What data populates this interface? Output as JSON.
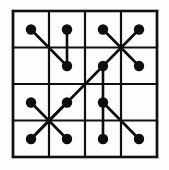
{
  "figure": {
    "type": "grid-diagram",
    "background_color": "#fdfdfd",
    "ink_color": "#0d0d0d",
    "grid": {
      "rows": 4,
      "cols": 4,
      "left": 13,
      "top": 11,
      "right": 157,
      "bottom": 157,
      "cell_width": 36,
      "cell_height": 36.5,
      "x_lines": [
        13,
        49,
        85,
        121,
        157
      ],
      "y_lines": [
        11,
        47.5,
        84,
        120.5,
        157
      ],
      "border_stroke_width": 2.6,
      "line_stroke_width": 2.2,
      "line_color": "#111111"
    },
    "dot": {
      "radius": 5.2,
      "color": "#0d0d0d"
    },
    "nodes": [
      {
        "id": "r1c1",
        "row": 1,
        "col": 1,
        "x": 31,
        "y": 29.5
      },
      {
        "id": "r1c2",
        "row": 1,
        "col": 2,
        "x": 67,
        "y": 29.5
      },
      {
        "id": "r1c3",
        "row": 1,
        "col": 3,
        "x": 103,
        "y": 29.5
      },
      {
        "id": "r1c4",
        "row": 1,
        "col": 4,
        "x": 139,
        "y": 29.5
      },
      {
        "id": "r2c2",
        "row": 2,
        "col": 2,
        "x": 67,
        "y": 66
      },
      {
        "id": "r2c3",
        "row": 2,
        "col": 3,
        "x": 103,
        "y": 66
      },
      {
        "id": "r2c4",
        "row": 2,
        "col": 4,
        "x": 139,
        "y": 66
      },
      {
        "id": "r3c1",
        "row": 3,
        "col": 1,
        "x": 31,
        "y": 102.5
      },
      {
        "id": "r3c2",
        "row": 3,
        "col": 2,
        "x": 67,
        "y": 102.5
      },
      {
        "id": "r3c3",
        "row": 3,
        "col": 3,
        "x": 103,
        "y": 102.5
      },
      {
        "id": "r4c1",
        "row": 4,
        "col": 1,
        "x": 31,
        "y": 139
      },
      {
        "id": "r4c2",
        "row": 4,
        "col": 2,
        "x": 67,
        "y": 139
      },
      {
        "id": "r4c3",
        "row": 4,
        "col": 3,
        "x": 103,
        "y": 139
      },
      {
        "id": "r4c4",
        "row": 4,
        "col": 4,
        "x": 139,
        "y": 139
      }
    ],
    "edges": [
      {
        "id": "e1",
        "from": "r1c1",
        "to": "r2c2",
        "kind": "diagonal"
      },
      {
        "id": "e2",
        "from": "r1c2",
        "to": "r2c2",
        "kind": "vertical"
      },
      {
        "id": "e3",
        "from": "r1c3",
        "to": "r2c4",
        "kind": "diagonal"
      },
      {
        "id": "e4",
        "from": "r1c4",
        "to": "r2c3",
        "kind": "diagonal"
      },
      {
        "id": "e5",
        "from": "r2c3",
        "to": "r3c3",
        "kind": "vertical"
      },
      {
        "id": "e6",
        "from": "r2c3",
        "to": "r4c1",
        "kind": "long-diagonal"
      },
      {
        "id": "e7",
        "from": "r3c1",
        "to": "r4c2",
        "kind": "diagonal"
      },
      {
        "id": "e8",
        "from": "r3c2",
        "to": "r4c1",
        "kind": "diagonal"
      },
      {
        "id": "e9",
        "from": "r3c3",
        "to": "r4c3",
        "kind": "vertical"
      },
      {
        "id": "e10",
        "from": "r3c3",
        "to": "r4c4",
        "kind": "diagonal"
      }
    ]
  }
}
